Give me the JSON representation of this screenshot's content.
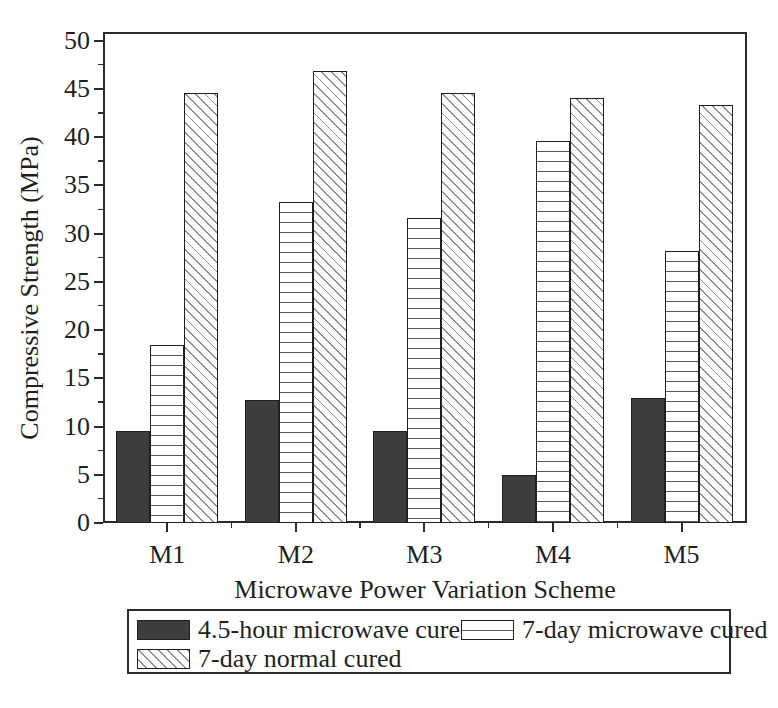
{
  "chart_data": {
    "type": "bar",
    "title": "",
    "categories": [
      "M1",
      "M2",
      "M3",
      "M4",
      "M5"
    ],
    "series": [
      {
        "name": "4.5-hour microwave cured",
        "pattern": "solid-dark",
        "values": [
          9.5,
          12.8,
          9.5,
          5.0,
          13.0
        ]
      },
      {
        "name": "7-day microwave cured",
        "pattern": "horizontal-lines",
        "values": [
          18.5,
          33.3,
          31.6,
          39.6,
          28.2
        ]
      },
      {
        "name": "7-day normal cured",
        "pattern": "diagonal-lines",
        "values": [
          44.6,
          46.9,
          44.6,
          44.1,
          43.3
        ]
      }
    ],
    "xlabel": "Microwave Power Variation Scheme",
    "ylabel": "Compressive Strength (MPa)",
    "ylim": [
      0,
      50
    ],
    "ytick_step": 5,
    "ytick_minor_step": 2.5,
    "grid": false,
    "legend_position": "bottom",
    "colors": {
      "dark_bar": "#3d3d3d",
      "horizontal_pattern_line": "#5a5a5a",
      "diagonal_pattern_line": "#8f8f8f",
      "axis": "#2b2b2b",
      "background": "#ffffff"
    }
  }
}
